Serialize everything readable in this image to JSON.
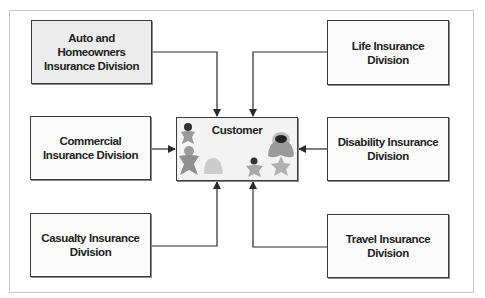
{
  "diagram": {
    "center": {
      "label": "Customer"
    },
    "divisions": [
      {
        "id": "auto",
        "label": "Auto and Homeowners Insurance Division",
        "position": "top-left"
      },
      {
        "id": "life",
        "label": "Life Insurance Division",
        "position": "top-right"
      },
      {
        "id": "commercial",
        "label": "Commercial Insurance Division",
        "position": "middle-left"
      },
      {
        "id": "disability",
        "label": "Disability Insurance Division",
        "position": "middle-right"
      },
      {
        "id": "casualty",
        "label": "Casualty Insurance Division",
        "position": "bottom-left"
      },
      {
        "id": "travel",
        "label": "Travel Insurance Division",
        "position": "bottom-right"
      }
    ],
    "edges": [
      {
        "from": "auto",
        "to": "customer"
      },
      {
        "from": "life",
        "to": "customer"
      },
      {
        "from": "commercial",
        "to": "customer"
      },
      {
        "from": "disability",
        "to": "customer"
      },
      {
        "from": "casualty",
        "to": "customer"
      },
      {
        "from": "travel",
        "to": "customer"
      }
    ],
    "colors": {
      "line": "#2a2a2a",
      "box_border": "#3a3a3a",
      "figure_gray": "#9a9a9a",
      "figure_light": "#c4c4c4",
      "figure_dark": "#333333"
    }
  }
}
